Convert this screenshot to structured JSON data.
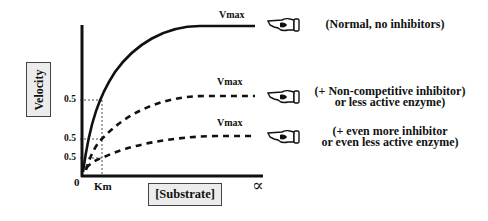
{
  "figure": {
    "y_axis_label": "Velocity",
    "x_axis_label": "[Substrate]",
    "origin_label": "0",
    "km_label": "Km",
    "infinity_label": "∝",
    "half_vmax_ticks": [
      "0.5",
      "0.5",
      "0.5"
    ],
    "curves": [
      {
        "name": "normal",
        "style": "solid",
        "vmax_label": "Vmax",
        "pointer_icon": "pointing-hand-icon",
        "description_lines": [
          "(Normal, no inhibitors)"
        ]
      },
      {
        "name": "non-competitive-inhibitor",
        "style": "dashed",
        "vmax_label": "Vmax",
        "pointer_icon": "pointing-hand-icon",
        "description_lines": [
          "(+ Non-competitive inhibitor)",
          "or less active enzyme)"
        ]
      },
      {
        "name": "more-inhibitor",
        "style": "dashed",
        "vmax_label": "Vmax",
        "pointer_icon": "pointing-hand-icon",
        "description_lines": [
          "(+ even more inhibitor",
          "or even less active enzyme)"
        ]
      }
    ],
    "colors": {
      "line": "#111111",
      "label_box_fill": "#ececec",
      "label_box_border": "#444444"
    }
  }
}
